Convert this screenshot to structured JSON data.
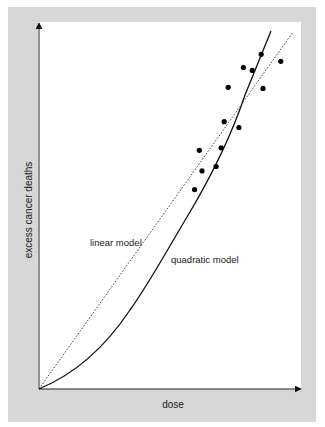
{
  "chart_data": {
    "type": "scatter",
    "title": "",
    "xlabel": "dose",
    "ylabel": "excess cancer deaths",
    "axis_ticks": "none",
    "grid": false,
    "legend": null,
    "annotations": [
      {
        "text": "linear model",
        "target": "dotted straight line"
      },
      {
        "text": "quadratic model",
        "target": "solid curve"
      }
    ],
    "xlim": [
      0,
      100
    ],
    "ylim": [
      0,
      100
    ],
    "points": [
      {
        "x": 59.4,
        "y": 54.4
      },
      {
        "x": 62.2,
        "y": 59.5
      },
      {
        "x": 61.2,
        "y": 65.1
      },
      {
        "x": 67.6,
        "y": 60.7
      },
      {
        "x": 69.5,
        "y": 65.8
      },
      {
        "x": 70.7,
        "y": 72.9
      },
      {
        "x": 76.3,
        "y": 71.3
      },
      {
        "x": 72.2,
        "y": 82.3
      },
      {
        "x": 78.0,
        "y": 87.7
      },
      {
        "x": 81.4,
        "y": 86.9
      },
      {
        "x": 84.8,
        "y": 91.3
      },
      {
        "x": 85.5,
        "y": 82.0
      },
      {
        "x": 92.3,
        "y": 89.4
      }
    ],
    "series": [
      {
        "name": "linear model",
        "style": "dotted",
        "x": [
          0,
          96.5
        ],
        "y": [
          0,
          97.3
        ]
      },
      {
        "name": "quadratic model",
        "style": "solid",
        "x": [
          0,
          16.2,
          35.3,
          47.6,
          56.3,
          63.6,
          72.2,
          88.1
        ],
        "y": [
          0,
          5.2,
          20.7,
          34.3,
          43.6,
          56.7,
          77.1,
          97.3
        ]
      }
    ]
  },
  "labels": {
    "xaxis": "dose",
    "yaxis": "excess cancer deaths",
    "linear": "linear model",
    "quadratic": "quadratic model"
  }
}
